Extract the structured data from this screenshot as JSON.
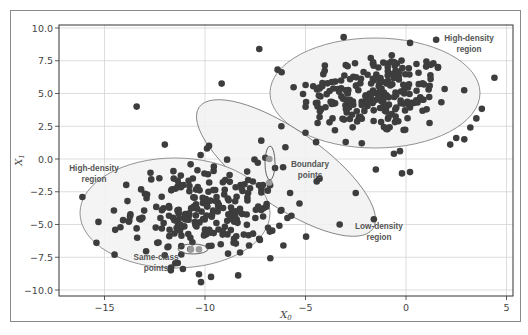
{
  "chart_data": {
    "type": "scatter",
    "title": "",
    "xlabel": "X0",
    "ylabel": "X1",
    "xlim": [
      -17.2,
      5.4
    ],
    "ylim": [
      -10.5,
      10.3
    ],
    "grid": true,
    "legend": null,
    "xticks": [
      -15,
      -10,
      -5,
      0,
      5
    ],
    "xtick_labels": [
      "−15",
      "−10",
      "−5",
      "0",
      "5"
    ],
    "yticks": [
      10.0,
      7.5,
      5.0,
      2.5,
      0.0,
      -2.5,
      -5.0,
      -7.5,
      -10.0
    ],
    "ytick_labels": [
      "10.0",
      "7.5",
      "5.0",
      "2.5",
      "0.0",
      "−2.5",
      "−5.0",
      "−7.5",
      "−10.0"
    ],
    "clusters": [
      {
        "name": "upper-right cluster",
        "center": [
          -1.5,
          5.0
        ],
        "std": [
          1.9,
          1.6
        ],
        "count": 230
      },
      {
        "name": "lower-left cluster",
        "center": [
          -10.0,
          -4.0
        ],
        "std": [
          1.8,
          1.7
        ],
        "count": 240
      }
    ],
    "extra_points": [
      [
        -7.3,
        8.4
      ],
      [
        -13.4,
        4.0
      ],
      [
        -12.0,
        1.1
      ],
      [
        -9.9,
        0.8
      ],
      [
        -9.8,
        1.0
      ],
      [
        -16.1,
        -2.9
      ],
      [
        -15.3,
        -4.8
      ],
      [
        -15.4,
        -6.4
      ],
      [
        -14.5,
        -7.3
      ],
      [
        -11.7,
        -8.5
      ],
      [
        -11.1,
        -8.4
      ],
      [
        -10.3,
        -8.8
      ],
      [
        -10.2,
        -9.4
      ],
      [
        -9.7,
        -9.0
      ],
      [
        4.4,
        6.2
      ],
      [
        3.5,
        3.1
      ],
      [
        3.2,
        2.4
      ],
      [
        2.9,
        1.5
      ],
      [
        2.5,
        1.6
      ],
      [
        2.2,
        1.1
      ],
      [
        -0.6,
        0.4
      ],
      [
        -0.3,
        0.6
      ],
      [
        -1.5,
        -0.8
      ],
      [
        -2.2,
        1.2
      ],
      [
        -3.0,
        1.3
      ],
      [
        -4.3,
        -1.5
      ],
      [
        -5.3,
        -3.4
      ],
      [
        -3.3,
        -5.0
      ],
      [
        -6.1,
        -6.6
      ],
      [
        -6.2,
        -3.9
      ],
      [
        -5.9,
        -4.5
      ],
      [
        -6.3,
        -5.1
      ],
      [
        -7.0,
        0.1
      ],
      [
        -6.0,
        0.9
      ],
      [
        -7.2,
        1.4
      ],
      [
        -1.6,
        -4.6
      ],
      [
        0.2,
        -1.0
      ],
      [
        -0.2,
        -1.1
      ],
      [
        -3.1,
        9.3
      ],
      [
        1.5,
        9.1
      ],
      [
        -4.4,
        4.0
      ],
      [
        -5.0,
        2.0
      ],
      [
        -4.3,
        3.2
      ],
      [
        -6.2,
        2.5
      ],
      [
        -2.5,
        -2.6
      ]
    ],
    "highlighted_points": [
      {
        "group": "boundary points",
        "points": [
          [
            -6.8,
            0.0
          ],
          [
            -6.8,
            -1.8
          ]
        ]
      },
      {
        "group": "same-class points",
        "points": [
          [
            -10.7,
            -6.9
          ],
          [
            -10.3,
            -6.9
          ]
        ]
      }
    ],
    "regions": [
      {
        "label": "High-density region (upper right)",
        "shape": "ellipse",
        "center": [
          -1.5,
          5.1
        ],
        "rx": 5.2,
        "ry": 4.2
      },
      {
        "label": "High-density region (lower left)",
        "shape": "ellipse",
        "center": [
          -11.5,
          -4.1
        ],
        "rx": 4.7,
        "ry": 4.2
      },
      {
        "label": "Boundary points",
        "shape": "ellipse",
        "center": [
          -5.9,
          -0.7
        ],
        "rx": 5.2,
        "ry": 3.0,
        "angle_deg": 35
      },
      {
        "label": "Low-density region",
        "shape": "text-only"
      }
    ],
    "point_color": "#3d3d3d",
    "highlight_color": "#9a9a9a",
    "region_fill": "#f0f0f0",
    "region_stroke": "#777777"
  },
  "annotations": {
    "high_density_upper_line1": "High-density",
    "high_density_upper_line2": "region",
    "high_density_lower_line1": "High-density",
    "high_density_lower_line2": "region",
    "boundary_line1": "Boundary",
    "boundary_line2": "points",
    "low_density_line1": "Low-density",
    "low_density_line2": "region",
    "same_class_line1": "Same-class",
    "same_class_line2": "points"
  },
  "axes": {
    "x_label": "X",
    "x_label_sub": "0",
    "y_label": "X",
    "y_label_sub": "1"
  }
}
